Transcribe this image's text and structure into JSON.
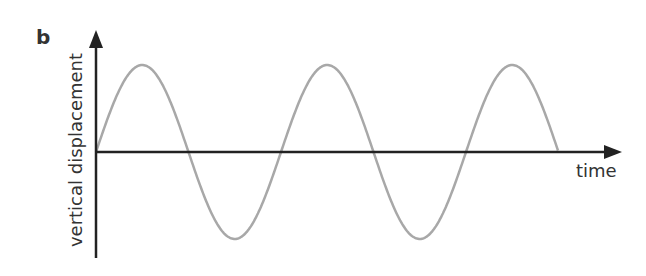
{
  "panel_label": "b",
  "chart_data": {
    "type": "line",
    "title": "",
    "xlabel": "time",
    "ylabel": "vertical displacement",
    "grid": false,
    "legend": null,
    "axes_origin_px": [
      96,
      152
    ],
    "series": [
      {
        "name": "wave",
        "shape": "sine",
        "start_phase": 0,
        "cycles": 2.5,
        "amplitude_px": 87,
        "period_px": 185,
        "color": "#a8a8a8"
      }
    ]
  },
  "colors": {
    "axis": "#222222",
    "wave": "#a8a8a8",
    "text": "#333333"
  }
}
